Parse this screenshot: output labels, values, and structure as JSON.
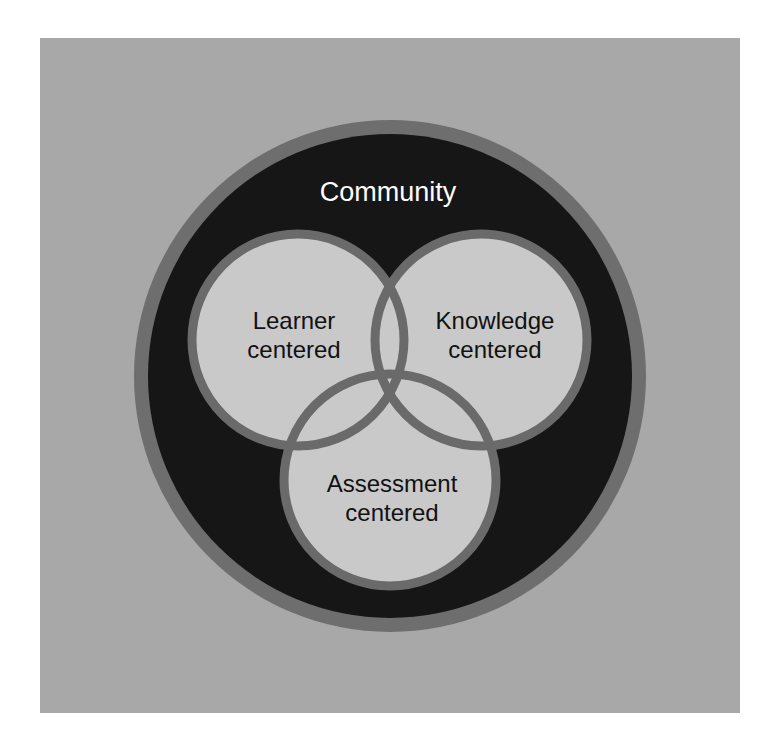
{
  "diagram": {
    "type": "venn",
    "outer_label": "Community",
    "circles": [
      {
        "id": "learner",
        "line1": "Learner",
        "line2": "centered"
      },
      {
        "id": "knowledge",
        "line1": "Knowledge",
        "line2": "centered"
      },
      {
        "id": "assessment",
        "line1": "Assessment",
        "line2": "centered"
      }
    ]
  },
  "colors": {
    "background": "#ffffff",
    "panel": "#a8a8a8",
    "outer_ring": "#6e6e6e",
    "community_fill": "#161616",
    "circle_fill": "#c9c9c9",
    "circle_stroke": "#6a6a6a",
    "outer_text": "#ffffff",
    "inner_text": "#111111"
  }
}
